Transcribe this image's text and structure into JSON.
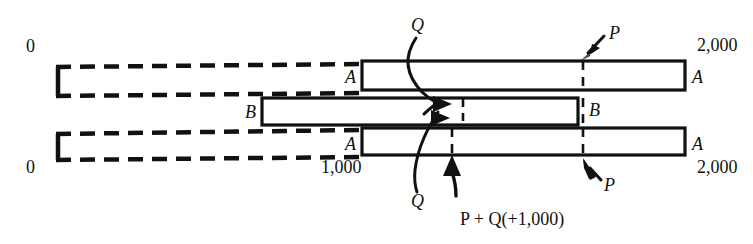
{
  "figure": {
    "colors": {
      "stroke": "#111111",
      "background": "#ffffff"
    },
    "labels": {
      "zero_top": "0",
      "zero_bottom": "0",
      "two_thousand_top": "2,000",
      "two_thousand_bottom": "2,000",
      "one_thousand": "1,000",
      "a_top_left": "A",
      "a_top_right": "A",
      "a_bottom_left": "A",
      "a_bottom_right": "A",
      "b_left": "B",
      "b_right": "B",
      "q_top": "Q",
      "q_bottom": "Q",
      "p_top": "P",
      "p_bottom": "P",
      "sum_caption": "P + Q(+1,000)"
    },
    "caption_parts": {
      "p": "P",
      "plus": "+",
      "q": "Q",
      "paren_open": "(",
      "plus_sign": "+",
      "value": "1,000",
      "paren_close": ")"
    },
    "bars": [
      {
        "name": "top-bar-a",
        "style": "solid",
        "x": 362,
        "y": 61,
        "width": 323,
        "height": 29
      },
      {
        "name": "middle-bar-b",
        "style": "solid",
        "x": 262,
        "y": 98,
        "width": 316,
        "height": 27
      },
      {
        "name": "bottom-bar-a",
        "style": "solid",
        "x": 362,
        "y": 128,
        "width": 323,
        "height": 27
      }
    ],
    "ghost_bars": [
      {
        "name": "top-ghost-bar",
        "style": "dashed",
        "x": 55,
        "y": 66,
        "width": 307,
        "height": 31
      },
      {
        "name": "middle-ghost-bar",
        "style": "dashed",
        "x": 262,
        "y": 98,
        "width": 0,
        "height": 0
      },
      {
        "name": "bottom-ghost-bar",
        "style": "dashed",
        "x": 55,
        "y": 133,
        "width": 307,
        "height": 28
      }
    ],
    "ticks": [
      {
        "name": "p-tick",
        "x": 583
      },
      {
        "name": "pq-tick",
        "x": 452
      },
      {
        "name": "q-tick",
        "x": 463
      }
    ]
  }
}
